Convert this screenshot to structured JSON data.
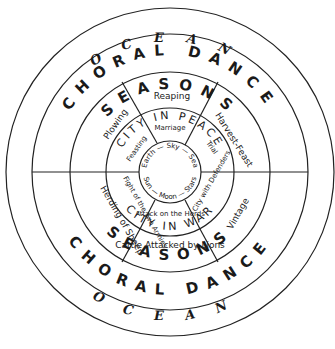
{
  "ocean": "OCEAN",
  "choral": "CHORAL DANCE",
  "seasons": "SEASONS",
  "season_scenes": {
    "top": "Reaping",
    "left_top": "Plowing",
    "right_top": "Harvest-Feast",
    "left_bottom": "Herding of Sheep",
    "bottom": "Cattle Attacked by Lions",
    "right_bottom": "Vintage"
  },
  "city_peace": "CITY IN PEACE",
  "city_war": "CITY IN WAR",
  "peace": {
    "marriage": "Marriage",
    "feasting": "Feasting",
    "trial": "Trial"
  },
  "war": {
    "fight": "Fight of the Two Armies",
    "attack": "Attack on the Herds",
    "city": "City with Defenders"
  },
  "center": {
    "top": "Earth — Sky — Sea",
    "bottom": "Sun — Moon — Stars"
  }
}
